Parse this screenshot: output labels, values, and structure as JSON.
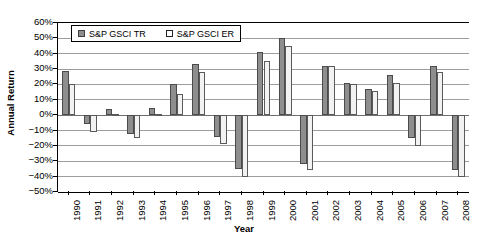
{
  "chart_data": {
    "type": "bar",
    "title": "",
    "xlabel": "Year",
    "ylabel": "Annual Return",
    "grid": true,
    "legend_position": "top-left-inside",
    "ylim": [
      -50,
      60
    ],
    "ytick_step": 10,
    "ytick_labels": [
      "60%",
      "50%",
      "40%",
      "30%",
      "20%",
      "10%",
      "0%",
      "−10%",
      "−20%",
      "−30%",
      "−40%",
      "−50%"
    ],
    "ytick_values": [
      60,
      50,
      40,
      30,
      20,
      10,
      0,
      -10,
      -20,
      -30,
      -40,
      -50
    ],
    "categories": [
      "1990",
      "1991",
      "1992",
      "1993",
      "1994",
      "1995",
      "1996",
      "1997",
      "1998",
      "1999",
      "2000",
      "2001",
      "2002",
      "2003",
      "2004",
      "2005",
      "2006",
      "2007",
      "2008"
    ],
    "series": [
      {
        "name": "S&P GSCI TR",
        "color": "#8e8e8e",
        "values": [
          29,
          -6,
          4,
          -12,
          5,
          20,
          33,
          -14,
          -35,
          41,
          50,
          -32,
          32,
          21,
          17,
          26,
          -15,
          32,
          -36
        ]
      },
      {
        "name": "S&P GSCI ER",
        "color": "#f2f2f2",
        "values": [
          20,
          -11,
          1,
          -15,
          1,
          14,
          28,
          -19,
          -40,
          35,
          45,
          -36,
          32,
          20,
          16,
          21,
          -20,
          28,
          -40
        ]
      }
    ]
  },
  "legend": {
    "items": [
      {
        "label": "S&P GSCI TR",
        "swatch": "filled-gray-square"
      },
      {
        "label": "S&P GSCI ER",
        "swatch": "hollow-white-square"
      }
    ]
  },
  "axes": {
    "y_title": "Annual Return",
    "x_title": "Year"
  }
}
